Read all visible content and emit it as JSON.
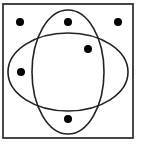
{
  "diagram": {
    "type": "venn",
    "background": "#ffffff",
    "stroke_color": "#222222",
    "frame_color": "#333333",
    "dot_color": "#000000",
    "universe": {
      "shape": "rectangle",
      "x": 3,
      "y": 4,
      "width": 130,
      "height": 134,
      "stroke_width": 1.8
    },
    "sets": [
      {
        "name": "vertical-ellipse",
        "cx": 68,
        "cy": 72,
        "rx": 36,
        "ry": 62,
        "stroke_width": 1.6
      },
      {
        "name": "horizontal-ellipse",
        "cx": 68,
        "cy": 72,
        "rx": 60,
        "ry": 39,
        "stroke_width": 1.6
      }
    ],
    "points": [
      {
        "name": "dot-top-left",
        "region": "outside-both",
        "cx": 20,
        "cy": 22,
        "r": 4
      },
      {
        "name": "dot-top-center",
        "region": "vertical-only",
        "cx": 68,
        "cy": 22,
        "r": 4
      },
      {
        "name": "dot-top-right",
        "region": "outside-both",
        "cx": 118,
        "cy": 22,
        "r": 4
      },
      {
        "name": "dot-upper-right-inner",
        "region": "both",
        "cx": 88,
        "cy": 49,
        "r": 4
      },
      {
        "name": "dot-middle-left",
        "region": "horizontal-only",
        "cx": 21,
        "cy": 72,
        "r": 4
      },
      {
        "name": "dot-bottom-center",
        "region": "vertical-only",
        "cx": 68,
        "cy": 119,
        "r": 4
      }
    ]
  }
}
